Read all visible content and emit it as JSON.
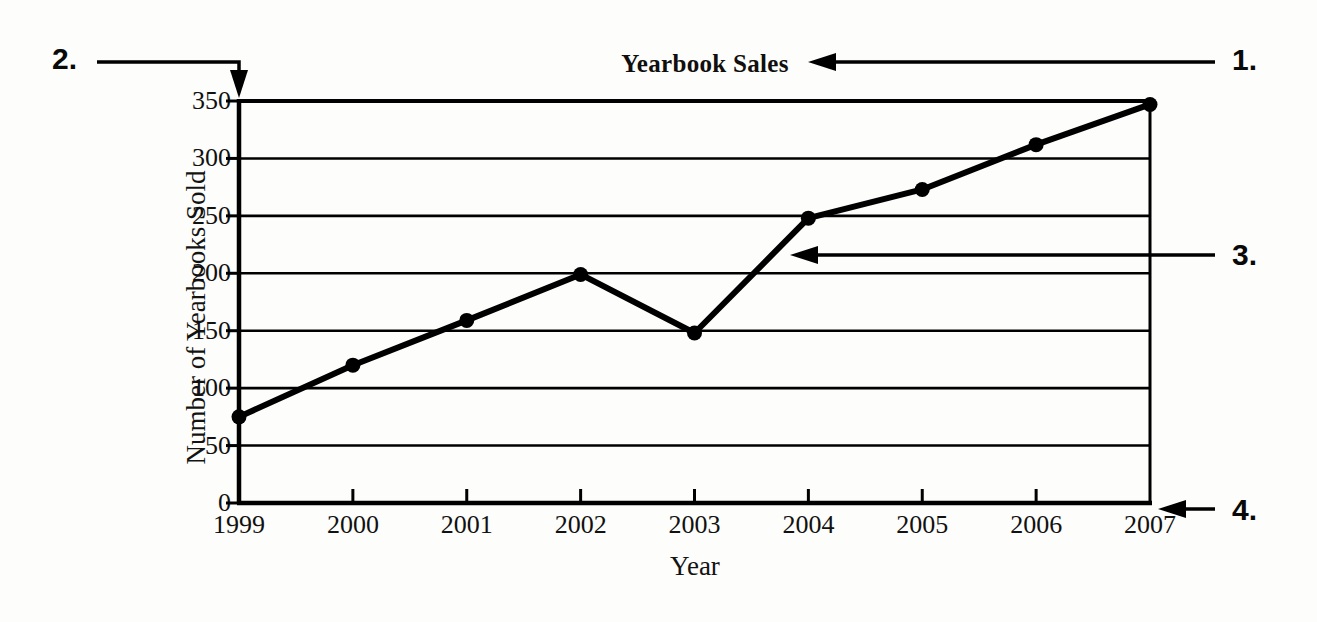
{
  "chart_data": {
    "type": "line",
    "title": "Yearbook Sales",
    "xlabel": "Year",
    "ylabel": "Number of Yearbooks Sold",
    "categories": [
      "1999",
      "2000",
      "2001",
      "2002",
      "2003",
      "2004",
      "2005",
      "2006",
      "2007"
    ],
    "values": [
      75,
      120,
      159,
      199,
      148,
      248,
      273,
      312,
      347
    ],
    "ylim": [
      0,
      350
    ],
    "yticks": [
      0,
      50,
      100,
      150,
      200,
      250,
      300,
      350
    ],
    "ytick_labels": [
      "0",
      "50",
      "100",
      "150",
      "200",
      "250",
      "300",
      "350"
    ],
    "grid": "horizontal",
    "legend": "none",
    "marker": "filled-circle",
    "line_color": "#000000",
    "marker_color": "#000000",
    "background_color": "#fdfdfb"
  },
  "annotations": {
    "items": [
      {
        "id": "1",
        "label": "1.",
        "points_to": "chart-title",
        "direction": "left"
      },
      {
        "id": "2",
        "label": "2.",
        "points_to": "y-axis",
        "direction": "down"
      },
      {
        "id": "3",
        "label": "3.",
        "points_to": "data-line",
        "direction": "left"
      },
      {
        "id": "4",
        "label": "4.",
        "points_to": "x-axis",
        "direction": "left"
      }
    ]
  }
}
